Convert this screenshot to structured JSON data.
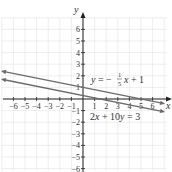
{
  "chart_data": {
    "type": "line",
    "title": "",
    "xlabel": "x",
    "ylabel": "y",
    "xlim": [
      -7,
      7
    ],
    "ylim": [
      -6,
      7
    ],
    "grid": true,
    "x_ticks": [
      "-6",
      "-5",
      "-4",
      "-3",
      "-2",
      "-1",
      "1",
      "2",
      "3",
      "4",
      "5",
      "6"
    ],
    "y_ticks": [
      "6",
      "5",
      "4",
      "3",
      "2",
      "1",
      "-1",
      "-2",
      "-3",
      "-4",
      "-5",
      "-6"
    ],
    "series": [
      {
        "name": "y = -1/5 x + 1",
        "slope": -0.2,
        "intercept": 1,
        "x": [
          -7,
          7
        ],
        "y": [
          2.4,
          -0.4
        ],
        "color": "#6b6b6b"
      },
      {
        "name": "2x + 10y = 3",
        "slope": -0.2,
        "intercept": 0.3,
        "x": [
          -7,
          7
        ],
        "y": [
          1.7,
          -1.1
        ],
        "color": "#6b6b6b"
      }
    ],
    "annotations": [
      {
        "text": "y = -1/5 x + 1",
        "x": 1,
        "y": 1.7
      },
      {
        "text": "2x + 10y = 3",
        "x": 0.7,
        "y": -1.4
      }
    ]
  },
  "labels": {
    "x_axis": "x",
    "y_axis": "y",
    "eq1_prefix": "y = −",
    "eq1_num": "1",
    "eq1_den": "5",
    "eq1_suffix": "x + 1",
    "eq2": "2x + 10y = 3"
  }
}
